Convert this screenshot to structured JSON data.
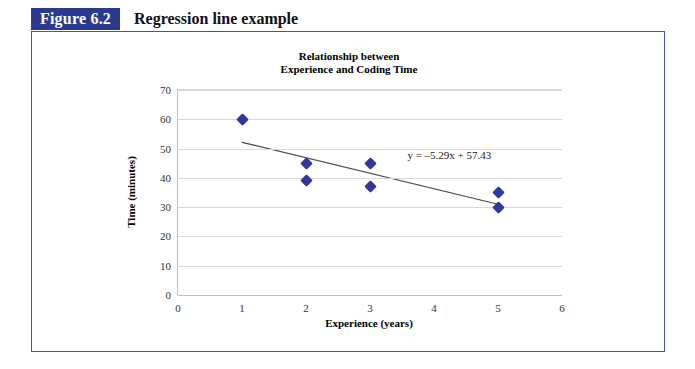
{
  "figure": {
    "number_label": "Figure 6.2",
    "caption": "Regression line example",
    "accent_color": "#2a3b8f",
    "frame_color": "#4a53a8"
  },
  "chart_data": {
    "type": "scatter",
    "title_lines": [
      "Relationship between",
      "Experience and Coding Time"
    ],
    "title": "Relationship between Experience and Coding Time",
    "xlabel": "Experience (years)",
    "ylabel": "Time (minutes)",
    "xlim": [
      0,
      6
    ],
    "ylim": [
      0,
      70
    ],
    "xticks": [
      "0",
      "1",
      "2",
      "3",
      "4",
      "5",
      "6"
    ],
    "xtick_values": [
      0,
      1,
      2,
      3,
      4,
      5,
      6
    ],
    "yticks": [
      "0",
      "10",
      "20",
      "30",
      "40",
      "50",
      "60",
      "70"
    ],
    "ytick_values": [
      0,
      10,
      20,
      30,
      40,
      50,
      60,
      70
    ],
    "grid": "horizontal",
    "legend": "none",
    "marker": "diamond",
    "marker_color": "#31369e",
    "points": [
      {
        "x": 1,
        "y": 60
      },
      {
        "x": 2,
        "y": 45
      },
      {
        "x": 2,
        "y": 39
      },
      {
        "x": 3,
        "y": 45
      },
      {
        "x": 3,
        "y": 37
      },
      {
        "x": 5,
        "y": 35
      },
      {
        "x": 5,
        "y": 30
      }
    ],
    "trendline": {
      "equation": "y = –5.29x + 57.43",
      "slope": -5.29,
      "intercept": 57.43,
      "x_start": 1,
      "y_start": 52.14,
      "x_end": 5,
      "y_end": 30.98,
      "color": "#4a4a4a"
    },
    "annotations": [
      {
        "text": "y = –5.29x + 57.43",
        "x": 3.6,
        "y": 47
      }
    ]
  }
}
